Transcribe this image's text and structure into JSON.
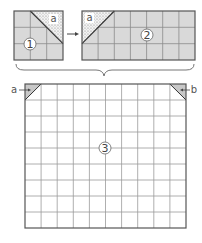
{
  "diagram": {
    "piece1": {
      "number": "1",
      "label": "a",
      "grid": {
        "cols": 3,
        "rows": 3
      }
    },
    "arrow": "→",
    "piece2": {
      "number": "2",
      "label": "a",
      "grid": {
        "cols": 7,
        "rows": 3
      }
    },
    "piece3": {
      "number": "3",
      "grid": {
        "cols": 10,
        "rows": 9
      },
      "corner_left_label": "a",
      "corner_right_label": "b"
    }
  },
  "colors": {
    "piece_fill": "#d9d9d9",
    "grid_line": "#8a8a8a",
    "border": "#555555",
    "dotted_fill": "#eeeeee",
    "corner_fill": "#c8c8c8"
  }
}
